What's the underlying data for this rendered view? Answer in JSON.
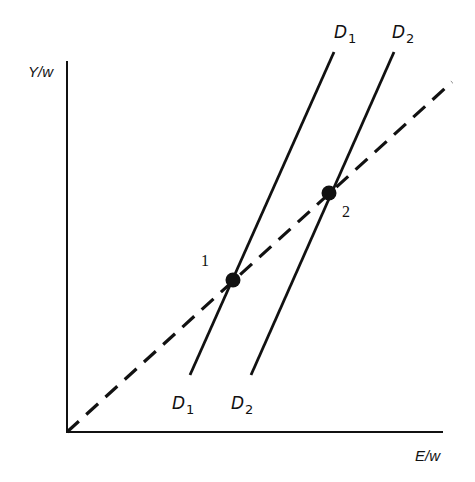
{
  "diagram": {
    "type": "economics-graph",
    "y_axis": {
      "label": "Y/w"
    },
    "x_axis": {
      "label": "E/w"
    },
    "colors": {
      "ink": "#111111",
      "background": "#ffffff"
    },
    "lines": [
      {
        "id": "D1",
        "style": "solid",
        "label_main": "D",
        "label_sub": "1",
        "top": [
          334,
          52
        ],
        "bottom": [
          190,
          375
        ]
      },
      {
        "id": "D2",
        "style": "solid",
        "label_main": "D",
        "label_sub": "2",
        "top": [
          394,
          52
        ],
        "bottom": [
          251,
          375
        ]
      },
      {
        "id": "ray",
        "style": "dashed",
        "from": [
          67,
          432
        ],
        "to": [
          452,
          82
        ]
      }
    ],
    "points": [
      {
        "label": "1",
        "x": 233,
        "y": 280
      },
      {
        "label": "2",
        "x": 329,
        "y": 193
      }
    ]
  }
}
